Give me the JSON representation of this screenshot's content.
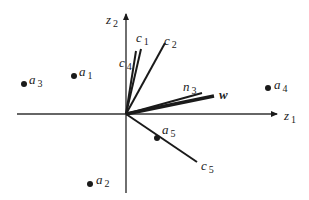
{
  "diagram": {
    "origin": [
      126,
      114
    ],
    "axes": {
      "z1": {
        "label": "z",
        "sub": "1",
        "from": [
          17,
          114
        ],
        "to": [
          277,
          114
        ],
        "label_pos": [
          284,
          120
        ]
      },
      "z2": {
        "label": "z",
        "sub": "2",
        "from": [
          126,
          193
        ],
        "to": [
          126,
          14
        ],
        "label_pos": [
          106,
          24
        ]
      }
    },
    "vectors": [
      {
        "id": "c1",
        "label": "c",
        "sub": "1",
        "to": [
          141,
          49
        ],
        "label_pos": [
          136,
          42
        ],
        "width": 2
      },
      {
        "id": "c2",
        "label": "c",
        "sub": "2",
        "to": [
          165,
          43
        ],
        "label_pos": [
          164,
          45
        ],
        "width": 2
      },
      {
        "id": "c4",
        "label": "c",
        "sub": "4",
        "to": [
          136,
          51
        ],
        "label_pos": [
          119,
          67
        ],
        "width": 2
      },
      {
        "id": "n3",
        "label": "n",
        "sub": "3",
        "to": [
          202,
          93
        ],
        "label_pos": [
          183,
          91
        ],
        "width": 2
      },
      {
        "id": "w",
        "label": "w",
        "sub": "",
        "to": [
          214,
          96
        ],
        "label_pos": [
          219,
          99
        ],
        "width": 3.5,
        "bold": true
      },
      {
        "id": "c5",
        "label": "c",
        "sub": "5",
        "to": [
          197,
          162
        ],
        "label_pos": [
          201,
          170
        ],
        "width": 2
      }
    ],
    "points": [
      {
        "id": "a1",
        "label": "a",
        "sub": "1",
        "pos": [
          74,
          76
        ],
        "label_pos": [
          79,
          76
        ]
      },
      {
        "id": "a2",
        "label": "a",
        "sub": "2",
        "pos": [
          90,
          184
        ],
        "label_pos": [
          96,
          184
        ]
      },
      {
        "id": "a3",
        "label": "a",
        "sub": "3",
        "pos": [
          24,
          84
        ],
        "label_pos": [
          29,
          84
        ]
      },
      {
        "id": "a4",
        "label": "a",
        "sub": "4",
        "pos": [
          268,
          88
        ],
        "label_pos": [
          274,
          89
        ]
      },
      {
        "id": "a5",
        "label": "a",
        "sub": "5",
        "pos": [
          157,
          138
        ],
        "label_pos": [
          162,
          134
        ]
      }
    ],
    "colors": {
      "ink": "#1a1a1a",
      "axis": "#333333"
    }
  }
}
